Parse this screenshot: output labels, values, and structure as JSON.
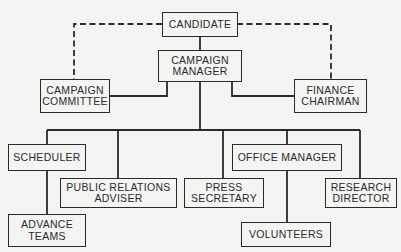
{
  "diagram": {
    "type": "organizational-chart",
    "colors": {
      "line": "#2a2a2a",
      "background": "#f4f4f2"
    },
    "nodes": {
      "candidate": {
        "line1": "CANDIDATE"
      },
      "campaign_manager": {
        "line1": "CAMPAIGN",
        "line2": "MANAGER"
      },
      "campaign_committee": {
        "line1": "CAMPAIGN",
        "line2": "COMMITTEE"
      },
      "finance_chairman": {
        "line1": "FINANCE",
        "line2": "CHAIRMAN"
      },
      "scheduler": {
        "line1": "SCHEDULER"
      },
      "public_relations_adviser": {
        "line1": "PUBLIC RELATIONS",
        "line2": "ADVISER"
      },
      "press_secretary": {
        "line1": "PRESS",
        "line2": "SECRETARY"
      },
      "office_manager": {
        "line1": "OFFICE MANAGER"
      },
      "research_director": {
        "line1": "RESEARCH",
        "line2": "DIRECTOR"
      },
      "advance_teams": {
        "line1": "ADVANCE",
        "line2": "TEAMS"
      },
      "volunteers": {
        "line1": "VOLUNTEERS"
      }
    },
    "edges": [
      {
        "from": "CANDIDATE",
        "to": "CAMPAIGN MANAGER",
        "style": "solid"
      },
      {
        "from": "CANDIDATE",
        "to": "CAMPAIGN COMMITTEE",
        "style": "dashed"
      },
      {
        "from": "CANDIDATE",
        "to": "FINANCE CHAIRMAN",
        "style": "dashed"
      },
      {
        "from": "CAMPAIGN MANAGER",
        "to": "CAMPAIGN COMMITTEE",
        "style": "solid"
      },
      {
        "from": "CAMPAIGN MANAGER",
        "to": "FINANCE CHAIRMAN",
        "style": "solid"
      },
      {
        "from": "CAMPAIGN MANAGER",
        "to": "SCHEDULER",
        "style": "solid"
      },
      {
        "from": "CAMPAIGN MANAGER",
        "to": "PUBLIC RELATIONS ADVISER",
        "style": "solid"
      },
      {
        "from": "CAMPAIGN MANAGER",
        "to": "PRESS SECRETARY",
        "style": "solid"
      },
      {
        "from": "CAMPAIGN MANAGER",
        "to": "OFFICE MANAGER",
        "style": "solid"
      },
      {
        "from": "CAMPAIGN MANAGER",
        "to": "RESEARCH DIRECTOR",
        "style": "solid"
      },
      {
        "from": "SCHEDULER",
        "to": "ADVANCE TEAMS",
        "style": "solid"
      },
      {
        "from": "OFFICE MANAGER",
        "to": "VOLUNTEERS",
        "style": "solid"
      }
    ]
  }
}
